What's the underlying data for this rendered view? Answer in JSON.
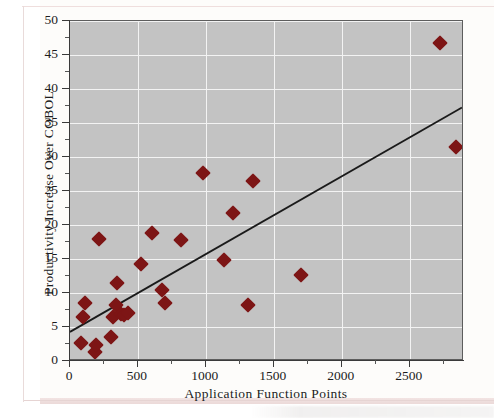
{
  "figure": {
    "y_axis_title": "Productivity Increase Over COBOL",
    "x_axis_title": "Application Function Points"
  },
  "chart_data": {
    "type": "scatter",
    "title": "",
    "xlabel": "Application Function Points",
    "ylabel": "Productivity Increase Over COBOL",
    "xlim": [
      0,
      2900
    ],
    "ylim": [
      0,
      50
    ],
    "xticks": [
      0,
      500,
      1000,
      1500,
      2000,
      2500
    ],
    "xtick_labels": [
      "0",
      "500",
      "1000",
      "1500",
      "2000",
      "2500"
    ],
    "yticks": [
      0,
      5,
      10,
      15,
      20,
      25,
      30,
      35,
      40,
      45,
      50
    ],
    "ytick_labels": [
      "0",
      "5",
      "10",
      "15",
      "20",
      "25",
      "30",
      "35",
      "40",
      "45",
      "50"
    ],
    "x_minor_tick_step": 250,
    "y_minor_tick_step": 2.5,
    "grid": true,
    "grid_color": "#f3f3f3",
    "plot_background": "#c3c3c3",
    "marker": "diamond",
    "marker_color": "#7d1515",
    "legend": null,
    "points": [
      {
        "x": 80,
        "y": 2.6
      },
      {
        "x": 95,
        "y": 6.5
      },
      {
        "x": 110,
        "y": 8.6
      },
      {
        "x": 185,
        "y": 1.3
      },
      {
        "x": 190,
        "y": 2.3
      },
      {
        "x": 215,
        "y": 17.9
      },
      {
        "x": 300,
        "y": 3.5
      },
      {
        "x": 320,
        "y": 6.4
      },
      {
        "x": 340,
        "y": 8.2
      },
      {
        "x": 345,
        "y": 11.4
      },
      {
        "x": 375,
        "y": 6.9
      },
      {
        "x": 395,
        "y": 6.8
      },
      {
        "x": 430,
        "y": 7.0
      },
      {
        "x": 520,
        "y": 14.2
      },
      {
        "x": 600,
        "y": 18.8
      },
      {
        "x": 680,
        "y": 10.4
      },
      {
        "x": 700,
        "y": 8.6
      },
      {
        "x": 820,
        "y": 17.8
      },
      {
        "x": 980,
        "y": 27.6
      },
      {
        "x": 1130,
        "y": 14.9
      },
      {
        "x": 1200,
        "y": 21.7
      },
      {
        "x": 1310,
        "y": 8.2
      },
      {
        "x": 1350,
        "y": 26.4
      },
      {
        "x": 1700,
        "y": 12.6
      },
      {
        "x": 2720,
        "y": 46.8
      },
      {
        "x": 2840,
        "y": 31.5
      }
    ],
    "trendline": {
      "type": "linear",
      "x_start": 0,
      "y_start": 4.0,
      "x_end": 2900,
      "y_end": 37.2,
      "color": "#1a1a1a"
    }
  }
}
